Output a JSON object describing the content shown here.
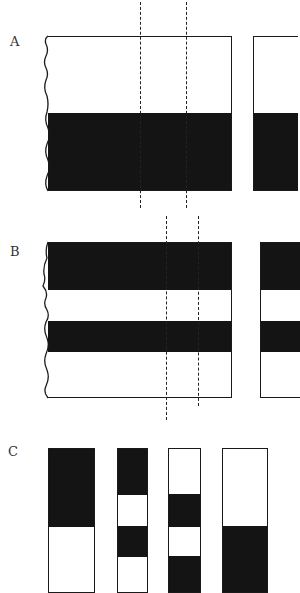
{
  "panels": [
    {
      "label": "A"
    },
    {
      "label": "B"
    },
    {
      "label": "C"
    }
  ],
  "colors": {
    "fill": "#141414",
    "line": "#1a1a1a",
    "background": "#ffffff"
  }
}
